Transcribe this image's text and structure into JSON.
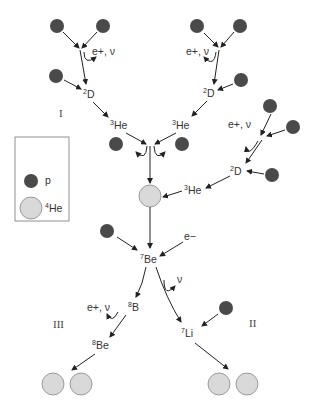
{
  "colors": {
    "proton": "#4a4a4a",
    "helium4": "#d9d9d9",
    "helium4_stroke": "#888888",
    "arrow": "#222222",
    "text": "#333333"
  },
  "legend": {
    "items": [
      {
        "symbol": "proton-dark-circle",
        "label": "p"
      },
      {
        "symbol": "helium-light-circle",
        "label_sup": "4",
        "label": "He"
      }
    ]
  },
  "branches": {
    "I": "I",
    "II": "II",
    "III": "III"
  },
  "labels": {
    "emission_positron_neutrino": "e+, ν",
    "neutrino": "ν",
    "electron": "e−",
    "deuterium_left": {
      "sup": "2",
      "sym": "D"
    },
    "deuterium_right_top": {
      "sup": "2",
      "sym": "D"
    },
    "deuterium_right": {
      "sup": "2",
      "sym": "D"
    },
    "helium3_left": {
      "sup": "3",
      "sym": "He"
    },
    "helium3_right": {
      "sup": "3",
      "sym": "He"
    },
    "helium3_side": {
      "sup": "3",
      "sym": "He"
    },
    "beryllium7": {
      "sup": "7",
      "sym": "Be"
    },
    "boron8": {
      "sup": "8",
      "sym": "B"
    },
    "beryllium8": {
      "sup": "8",
      "sym": "Be"
    },
    "lithium7": {
      "sup": "7",
      "sym": "Li"
    }
  }
}
